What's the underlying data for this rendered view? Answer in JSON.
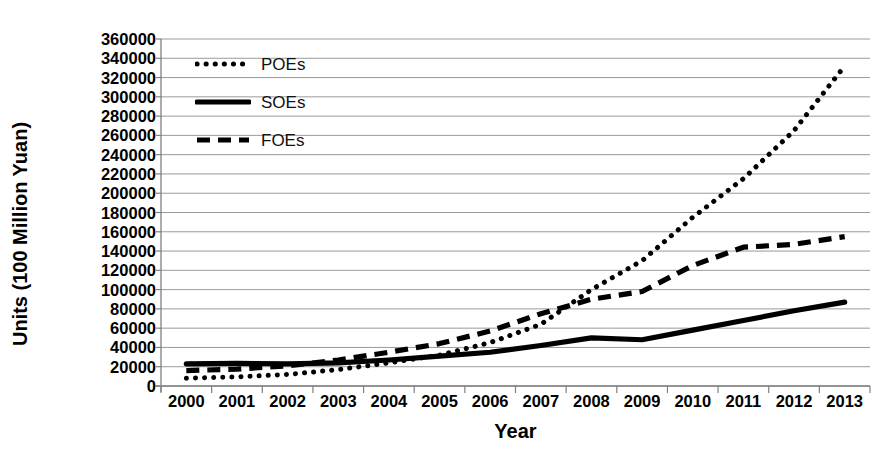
{
  "chart_data": {
    "type": "line",
    "title": "",
    "xlabel": "Year",
    "ylabel": "Units (100 Million Yuan)",
    "categories": [
      "2000",
      "2001",
      "2002",
      "2003",
      "2004",
      "2005",
      "2006",
      "2007",
      "2008",
      "2009",
      "2010",
      "2011",
      "2012",
      "2013"
    ],
    "x": [
      2000,
      2001,
      2002,
      2003,
      2004,
      2005,
      2006,
      2007,
      2008,
      2009,
      2010,
      2011,
      2012,
      2013
    ],
    "ylim": [
      0,
      360000
    ],
    "ytick_step": 20000,
    "yticks": [
      0,
      20000,
      40000,
      60000,
      80000,
      100000,
      120000,
      140000,
      160000,
      180000,
      200000,
      220000,
      240000,
      260000,
      280000,
      300000,
      320000,
      340000,
      360000
    ],
    "ytick_labels": [
      "360000",
      "340000",
      "320000",
      "300000",
      "280000",
      "260000",
      "240000",
      "220000",
      "200000",
      "180000",
      "160000",
      "140000",
      "120000",
      "100000",
      "80000",
      "60000",
      "40000",
      "20000",
      "0"
    ],
    "grid": true,
    "grid_axis": "y",
    "legend_position": "upper-left-inside",
    "series": [
      {
        "name": "POEs",
        "style": "dotted",
        "color": "#000000",
        "values": [
          8000,
          9500,
          12000,
          17000,
          24000,
          32000,
          45000,
          64000,
          100000,
          130000,
          175000,
          215000,
          265000,
          332000
        ]
      },
      {
        "name": "SOEs",
        "style": "solid",
        "color": "#000000",
        "values": [
          23000,
          23500,
          23000,
          24000,
          27000,
          31000,
          35000,
          42000,
          50000,
          48000,
          58000,
          68000,
          78000,
          87000
        ]
      },
      {
        "name": "FOEs",
        "style": "dashed",
        "color": "#000000",
        "values": [
          16000,
          17500,
          21000,
          27000,
          35000,
          44000,
          57000,
          75000,
          90000,
          98000,
          125000,
          144000,
          147000,
          155000
        ]
      }
    ]
  },
  "axis": {
    "y_title": "Units (100 Million Yuan)",
    "x_title": "Year"
  },
  "legend": {
    "items": [
      {
        "label": "POEs",
        "style": "dotted"
      },
      {
        "label": "SOEs",
        "style": "solid"
      },
      {
        "label": "FOEs",
        "style": "dashed"
      }
    ]
  },
  "colors": {
    "ink": "#000000",
    "gridline": "#9a9a9a",
    "axis": "#808080",
    "background": "#ffffff"
  }
}
